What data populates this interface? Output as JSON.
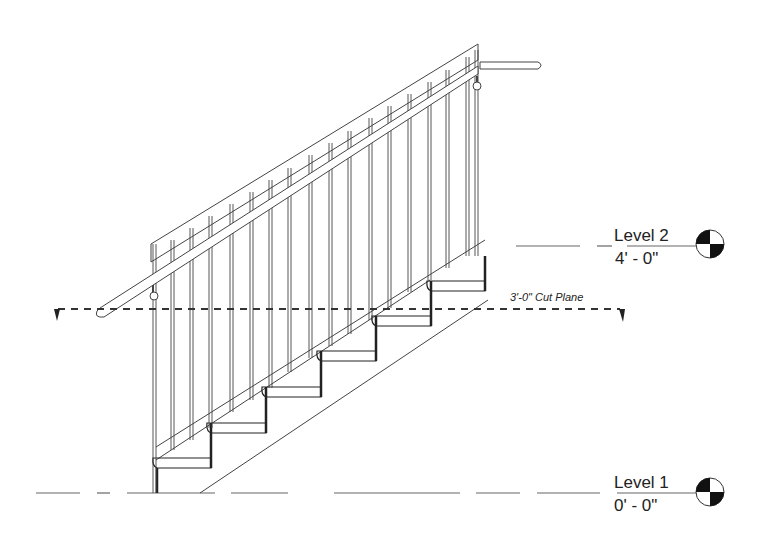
{
  "drawing": {
    "type": "stair-section-elevation",
    "levels": [
      {
        "name": "Level 2",
        "elevation": "4' - 0\""
      },
      {
        "name": "Level 1",
        "elevation": "0' - 0\""
      }
    ],
    "cut_plane": {
      "label": "3'-0\" Cut Plane"
    },
    "stair": {
      "risers": 6,
      "balusters": 18
    },
    "colors": {
      "line": "#222222",
      "light_line": "#555555",
      "background": "#ffffff"
    }
  }
}
